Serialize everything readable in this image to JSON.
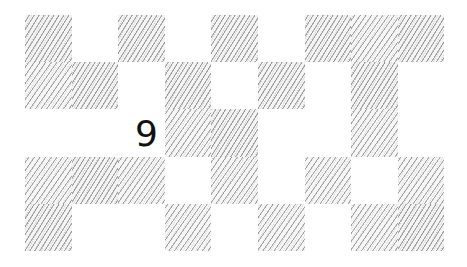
{
  "board": {
    "columns": 9,
    "rows": 5,
    "hatch_color": "#5a5a5a",
    "background_color": "#ffffff",
    "cells": [
      [
        {
          "filled": true
        },
        {
          "filled": false
        },
        {
          "filled": true
        },
        {
          "filled": false
        },
        {
          "filled": true
        },
        {
          "filled": false
        },
        {
          "filled": true
        },
        {
          "filled": true
        },
        {
          "filled": true
        }
      ],
      [
        {
          "filled": true
        },
        {
          "filled": true
        },
        {
          "filled": false
        },
        {
          "filled": true
        },
        {
          "filled": false
        },
        {
          "filled": true
        },
        {
          "filled": false
        },
        {
          "filled": true
        },
        {
          "filled": false
        }
      ],
      [
        {
          "filled": false
        },
        {
          "filled": false
        },
        {
          "filled": false,
          "clue": "9"
        },
        {
          "filled": true
        },
        {
          "filled": true
        },
        {
          "filled": false
        },
        {
          "filled": false
        },
        {
          "filled": true
        },
        {
          "filled": false
        }
      ],
      [
        {
          "filled": true
        },
        {
          "filled": true
        },
        {
          "filled": true
        },
        {
          "filled": false
        },
        {
          "filled": true
        },
        {
          "filled": false
        },
        {
          "filled": true
        },
        {
          "filled": false
        },
        {
          "filled": true
        }
      ],
      [
        {
          "filled": true
        },
        {
          "filled": false
        },
        {
          "filled": false
        },
        {
          "filled": true
        },
        {
          "filled": false
        },
        {
          "filled": true
        },
        {
          "filled": false
        },
        {
          "filled": true
        },
        {
          "filled": true
        }
      ]
    ]
  }
}
